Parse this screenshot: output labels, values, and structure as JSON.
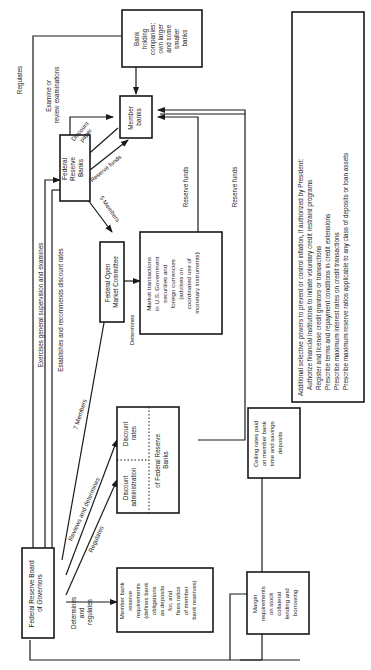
{
  "diagram": {
    "orientation": "rotated-90-ccw",
    "nodes": {
      "board": {
        "lines": [
          "Federal Reserve Board",
          "of Governors"
        ]
      },
      "fed_banks": {
        "lines": [
          "Federal",
          "Reserve",
          "Banks"
        ]
      },
      "member_banks": {
        "lines": [
          "Member",
          "banks"
        ]
      },
      "holding": {
        "lines": [
          "Bank",
          "holding",
          "companies:",
          "own larger",
          "and some",
          "smaller",
          "banks"
        ]
      },
      "fomc": {
        "lines": [
          "Federal Open",
          "Market Committee"
        ]
      },
      "market": {
        "lines": [
          "Market transactions",
          "in U.S. Government",
          "securities and",
          "foreign currencies",
          "(advises on",
          "coordinated use of",
          "monetary instruments)"
        ]
      },
      "discount": {
        "admin_lines": [
          "Discount",
          "administration"
        ],
        "rates_lines": [
          "Discount",
          "rates"
        ],
        "footer_lines": [
          "of Federal Reserve",
          "Banks"
        ]
      },
      "reserve_req": {
        "lines": [
          "Member bank",
          "reserve",
          "requirements",
          "(defines bank",
          "obligations",
          "as deposits",
          "for, and",
          "fixes ratios",
          "of member",
          "bank reserves)"
        ]
      },
      "margin": {
        "lines": [
          "Margin",
          "requirements",
          "on stock",
          "collateral",
          "lending and",
          "borrowing"
        ]
      },
      "ceiling": {
        "lines": [
          "Ceiling rates paid",
          "on member bank",
          "time and savings",
          "deposits"
        ]
      },
      "selective": {
        "lines": [
          "Additional selective powers to prevent or control inflation, if authorized by President:",
          "Authorize financial institutions to initiate voluntary credit restraint programs",
          "Register and license credit grantors or transactions",
          "Prescribe terms and repayment conditions in credit extensions",
          "Prescribe maximum interest rates on credit transactions",
          "Prescribe maximum reserve ratios applicable to any class of deposits or loan assets"
        ]
      }
    },
    "edge_labels": {
      "regulates_top": "Regulates",
      "examine": [
        "Examine or",
        "review examinations"
      ],
      "discount_paper": [
        "Discount",
        "paper"
      ],
      "reserve_funds_diag": "Reserve funds",
      "five_members": "5 Members",
      "exercises": "Exercises general supervision and examines",
      "establishes": "Establishes and recommends discount rates",
      "seven_members": "7 Members",
      "reviews": "Reviews and determines",
      "regulates_low": "Regulates",
      "determines_fomc": "Determines",
      "reserve_funds_1": "Reserve funds",
      "reserve_funds_2": "Reserve funds",
      "determines_regulates": [
        "Determines",
        "and",
        "regulates"
      ]
    }
  }
}
